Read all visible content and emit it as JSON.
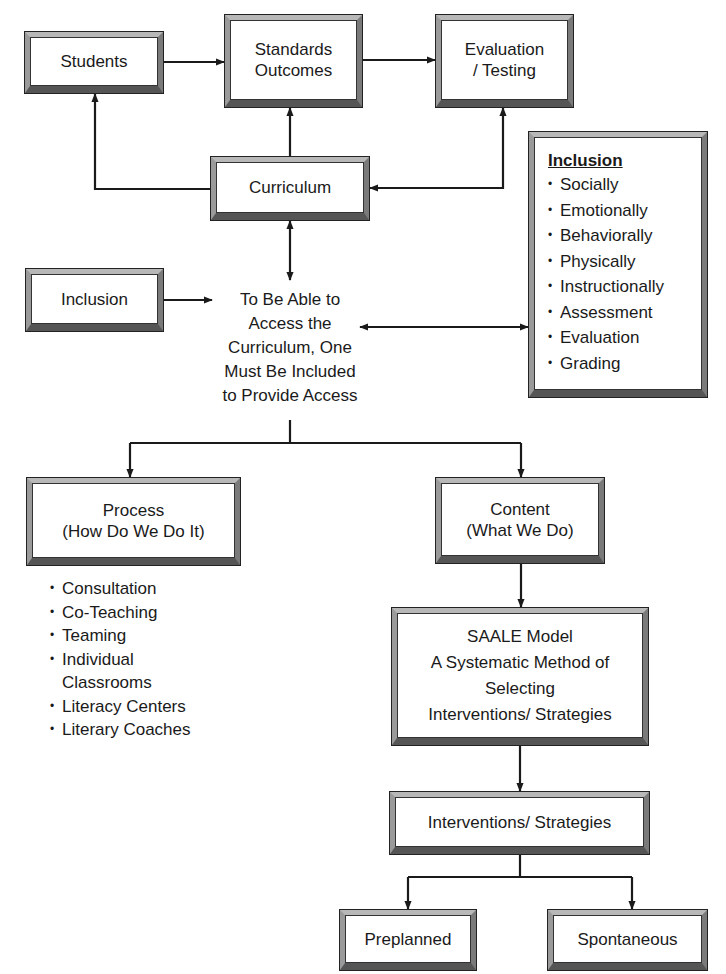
{
  "diagram": {
    "nodes": {
      "students": {
        "label": "Students"
      },
      "standards_outcomes": {
        "label": "Standards\nOutcomes"
      },
      "evaluation_testing": {
        "label": "Evaluation\n/ Testing"
      },
      "curriculum": {
        "label": "Curriculum"
      },
      "inclusion_source": {
        "label": "Inclusion"
      },
      "access_statement": {
        "label": "To Be Able to\nAccess the\nCurriculum, One\nMust Be Included\nto Provide Access"
      },
      "inclusion_panel": {
        "title": "Inclusion",
        "items": [
          "Socially",
          "Emotionally",
          "Behaviorally",
          "Physically",
          "Instructionally",
          "Assessment",
          "Evaluation",
          "Grading"
        ]
      },
      "process": {
        "label": "Process\n(How Do We Do It)",
        "items": [
          "Consultation",
          "Co-Teaching",
          "Teaming",
          "Individual\nClassrooms",
          "Literacy Centers",
          "Literary Coaches"
        ]
      },
      "content": {
        "label": "Content\n(What We Do)"
      },
      "saale_model": {
        "label": "SAALE Model\nA Systematic Method of\nSelecting\nInterventions/ Strategies"
      },
      "interventions_strategies": {
        "label": "Interventions/ Strategies"
      },
      "preplanned": {
        "label": "Preplanned"
      },
      "spontaneous": {
        "label": "Spontaneous"
      }
    },
    "edges": [
      {
        "from": "students",
        "to": "standards_outcomes",
        "type": "arrow"
      },
      {
        "from": "standards_outcomes",
        "to": "evaluation_testing",
        "type": "arrow"
      },
      {
        "from": "curriculum",
        "to": "standards_outcomes",
        "type": "arrow"
      },
      {
        "from": "curriculum",
        "to": "students",
        "type": "arrow"
      },
      {
        "from": "curriculum",
        "to": "evaluation_testing",
        "type": "double-arrow"
      },
      {
        "from": "curriculum",
        "to": "access_statement",
        "type": "double-arrow"
      },
      {
        "from": "inclusion_source",
        "to": "access_statement",
        "type": "arrow"
      },
      {
        "from": "access_statement",
        "to": "inclusion_panel",
        "type": "double-arrow"
      },
      {
        "from": "access_statement",
        "to": "process",
        "type": "arrow"
      },
      {
        "from": "access_statement",
        "to": "content",
        "type": "arrow"
      },
      {
        "from": "content",
        "to": "saale_model",
        "type": "arrow"
      },
      {
        "from": "saale_model",
        "to": "interventions_strategies",
        "type": "arrow"
      },
      {
        "from": "interventions_strategies",
        "to": "preplanned",
        "type": "arrow"
      },
      {
        "from": "interventions_strategies",
        "to": "spontaneous",
        "type": "arrow"
      }
    ],
    "colors": {
      "line": "#1a1a1a",
      "bevel_light": "#b8b8b8",
      "bevel_dark": "#555555",
      "background": "#ffffff"
    }
  }
}
